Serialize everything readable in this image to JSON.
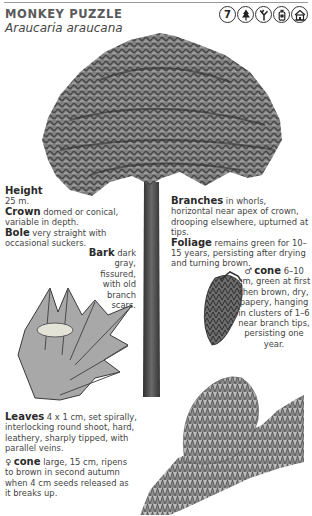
{
  "header": {
    "common_name": "MONKEY PUZZLE",
    "latin_name": "Araucaria araucana",
    "icons": [
      {
        "name": "number-7-icon",
        "glyph": "7"
      },
      {
        "name": "conifer-tree-icon",
        "glyph": ""
      },
      {
        "name": "branch-fork-icon",
        "glyph": ""
      },
      {
        "name": "bottle-icon",
        "glyph": ""
      },
      {
        "name": "building-icon",
        "glyph": ""
      }
    ]
  },
  "descriptions": {
    "height": {
      "label": "Height",
      "text": "25 m."
    },
    "crown": {
      "label": "Crown",
      "text": " domed or conical, variable in depth."
    },
    "bole": {
      "label": "Bole",
      "text": " very straight with occasional suckers."
    },
    "bark": {
      "label": "Bark",
      "text": " dark gray, fissured, with old branch scars."
    },
    "branches": {
      "label": "Branches",
      "text": " in whorls, horizontal near apex of crown, drooping elsewhere, upturned at tips."
    },
    "foliage": {
      "label": "Foliage",
      "text": " remains green for 10–15 years, persisting after drying and turning brown."
    },
    "male_cone": {
      "symbol": "♂",
      "label": "cone",
      "text": " 6–10 cm, green at first then brown, dry, papery, hanging in clusters of 1–6 near branch tips, persisting one year."
    },
    "leaves": {
      "label": "Leaves",
      "text": " 4 x 1 cm, set spirally, interlocking round shoot, hard, leathery, sharply tipped, with parallel veins."
    },
    "female_cone": {
      "symbol": "♀",
      "label": "cone",
      "text": " large, 15 cm, ripens to brown in second autumn when 4 cm seeds released as it breaks up."
    }
  },
  "colors": {
    "ink": "#3a3a3a",
    "foliage": "#5c5c5c",
    "trunk": "#4a4a4a",
    "rule": "#9a9a9a"
  }
}
